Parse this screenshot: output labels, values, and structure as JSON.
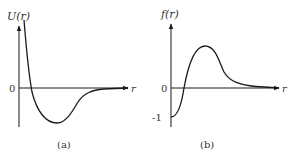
{
  "figure": {
    "panels": [
      {
        "id": "a",
        "caption": "(a)",
        "y_label": "U(r)",
        "x_label": "r",
        "origin_label": "0",
        "description": "Interatomic potential energy: steep repulsive wall at small r, crosses zero, potential well minimum, then approaches 0 from below."
      },
      {
        "id": "b",
        "caption": "(b)",
        "y_label": "f(r)",
        "x_label": "r",
        "origin_label": "0",
        "y_tick_label": "-1",
        "description": "Mayer function: starts at -1 at r=0, crosses zero, rises to positive maximum, decays to 0."
      }
    ]
  },
  "colors": {
    "stroke": "#1a1a1a",
    "text": "#333333",
    "background": "#ffffff"
  }
}
